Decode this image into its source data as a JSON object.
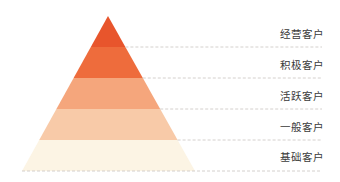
{
  "diagram": {
    "type": "pyramid",
    "levels": [
      {
        "label": "经营客户",
        "color": "#E8552C"
      },
      {
        "label": "积极客户",
        "color": "#EE6C3C"
      },
      {
        "label": "活跃客户",
        "color": "#F5A67C"
      },
      {
        "label": "一般客户",
        "color": "#F8CAA8"
      },
      {
        "label": "基础客户",
        "color": "#FCF4E4"
      }
    ],
    "divider_color": "#C9C4C0"
  }
}
